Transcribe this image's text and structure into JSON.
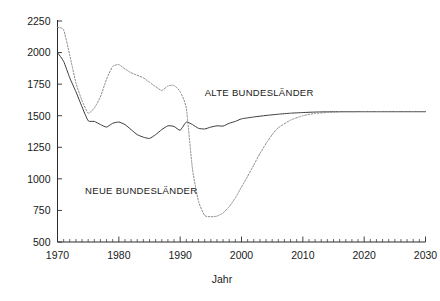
{
  "chart_data": {
    "type": "line",
    "title": "",
    "subtitle": "",
    "xlabel": "Jahr",
    "ylabel": "",
    "xlim": [
      1970,
      2030
    ],
    "ylim": [
      500,
      2250
    ],
    "grid": false,
    "legend_position": "inline-annotations",
    "x_ticks": [
      1970,
      1980,
      1990,
      2000,
      2010,
      2020,
      2030
    ],
    "x_tick_labels": [
      "1970",
      "1980",
      "1990",
      "2000",
      "2010",
      "2020",
      "2030"
    ],
    "x_minor_tick_step": 1,
    "y_ticks": [
      500,
      750,
      1000,
      1250,
      1500,
      1750,
      2000,
      2250
    ],
    "y_tick_labels": [
      "500",
      "750",
      "1000",
      "1250",
      "1500",
      "1750",
      "2000",
      "2250"
    ],
    "annotations": [
      {
        "text": "ALTE BUNDESLÄNDER",
        "x": 1994,
        "y": 1660
      },
      {
        "text": "NEUE BUNDESLÄNDER",
        "x": 1974.5,
        "y": 880
      }
    ],
    "series": [
      {
        "name": "ALTE BUNDESLÄNDER",
        "style": "solid",
        "color": "#3a3a3a",
        "x": [
          1970,
          1971,
          1972,
          1973,
          1974,
          1975,
          1976,
          1977,
          1978,
          1979,
          1980,
          1981,
          1982,
          1983,
          1984,
          1985,
          1986,
          1987,
          1988,
          1989,
          1990,
          1991,
          1992,
          1993,
          1994,
          1995,
          1996,
          1997,
          1998,
          1999,
          2000,
          2002,
          2004,
          2006,
          2008,
          2010,
          2012,
          2014,
          2016,
          2018,
          2020,
          2022,
          2024,
          2026,
          2028,
          2030
        ],
        "values": [
          2000,
          1930,
          1800,
          1690,
          1570,
          1460,
          1455,
          1430,
          1410,
          1440,
          1450,
          1430,
          1390,
          1350,
          1330,
          1320,
          1350,
          1390,
          1420,
          1415,
          1385,
          1450,
          1430,
          1400,
          1395,
          1410,
          1420,
          1418,
          1440,
          1455,
          1475,
          1490,
          1502,
          1512,
          1520,
          1525,
          1529,
          1531,
          1532,
          1532,
          1532,
          1532,
          1532,
          1532,
          1532,
          1532
        ]
      },
      {
        "name": "NEUE BUNDESLÄNDER",
        "style": "dotted",
        "color": "#8a8a8a",
        "x": [
          1970,
          1971,
          1972,
          1973,
          1974,
          1975,
          1976,
          1977,
          1978,
          1979,
          1980,
          1981,
          1982,
          1983,
          1984,
          1985,
          1986,
          1987,
          1988,
          1989,
          1990,
          1991,
          1992,
          1993,
          1994,
          1995,
          1996,
          1997,
          1998,
          1999,
          2000,
          2001,
          2002,
          2003,
          2004,
          2005,
          2006,
          2008,
          2010,
          2012,
          2014,
          2016,
          2018,
          2020,
          2022,
          2024,
          2026,
          2028,
          2030
        ],
        "values": [
          2200,
          2180,
          1980,
          1760,
          1620,
          1520,
          1560,
          1650,
          1790,
          1890,
          1905,
          1870,
          1840,
          1820,
          1800,
          1765,
          1730,
          1700,
          1735,
          1740,
          1690,
          1560,
          1080,
          820,
          710,
          700,
          705,
          730,
          780,
          850,
          935,
          1020,
          1110,
          1200,
          1280,
          1350,
          1405,
          1465,
          1500,
          1518,
          1526,
          1530,
          1531,
          1532,
          1532,
          1532,
          1532,
          1532,
          1532
        ]
      }
    ]
  },
  "axes": {
    "x_axis_title": "Jahr"
  },
  "icons": {}
}
